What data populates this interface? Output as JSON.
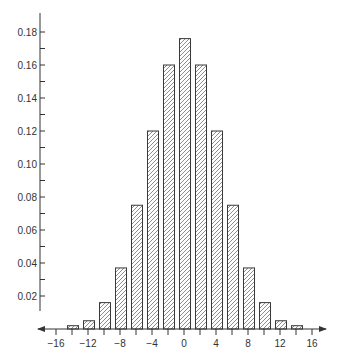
{
  "chart_data": {
    "type": "bar",
    "title": "",
    "xlabel": "",
    "ylabel": "",
    "categories": [
      -14,
      -12,
      -10,
      -8,
      -6,
      -4,
      -2,
      0,
      2,
      4,
      6,
      8,
      10,
      12,
      14
    ],
    "values": [
      0.002,
      0.005,
      0.016,
      0.037,
      0.075,
      0.12,
      0.16,
      0.176,
      0.16,
      0.12,
      0.075,
      0.037,
      0.016,
      0.005,
      0.002
    ],
    "x_ticks": [
      -16,
      -14,
      -12,
      -10,
      -8,
      -6,
      -4,
      -2,
      0,
      2,
      4,
      6,
      8,
      10,
      12,
      14,
      16
    ],
    "x_tick_labels": [
      "−16",
      "−12",
      "−8",
      "−4",
      "0",
      "4",
      "8",
      "12",
      "16"
    ],
    "x_tick_label_values": [
      -16,
      -12,
      -8,
      -4,
      0,
      4,
      8,
      12,
      16
    ],
    "y_ticks": [
      0.02,
      0.04,
      0.06,
      0.08,
      0.1,
      0.12,
      0.14,
      0.16,
      0.18
    ],
    "y_tick_labels": [
      "0.02",
      "0.04",
      "0.06",
      "0.08",
      "0.10",
      "0.12",
      "0.14",
      "0.16",
      "0.18"
    ],
    "y_minor_ticks": [
      0.01,
      0.03,
      0.05,
      0.07,
      0.09,
      0.11,
      0.13,
      0.15,
      0.17
    ],
    "xlim": [
      -17,
      18
    ],
    "ylim": [
      0,
      0.19
    ],
    "grid": false,
    "legend": null,
    "bar_style": "diagonal-hatch",
    "colors": {
      "axis": "#333333",
      "bar_outline": "#3a3a3a",
      "hatch": "#707070",
      "background": "#ffffff"
    }
  },
  "caption": {
    "visible_text": ""
  }
}
